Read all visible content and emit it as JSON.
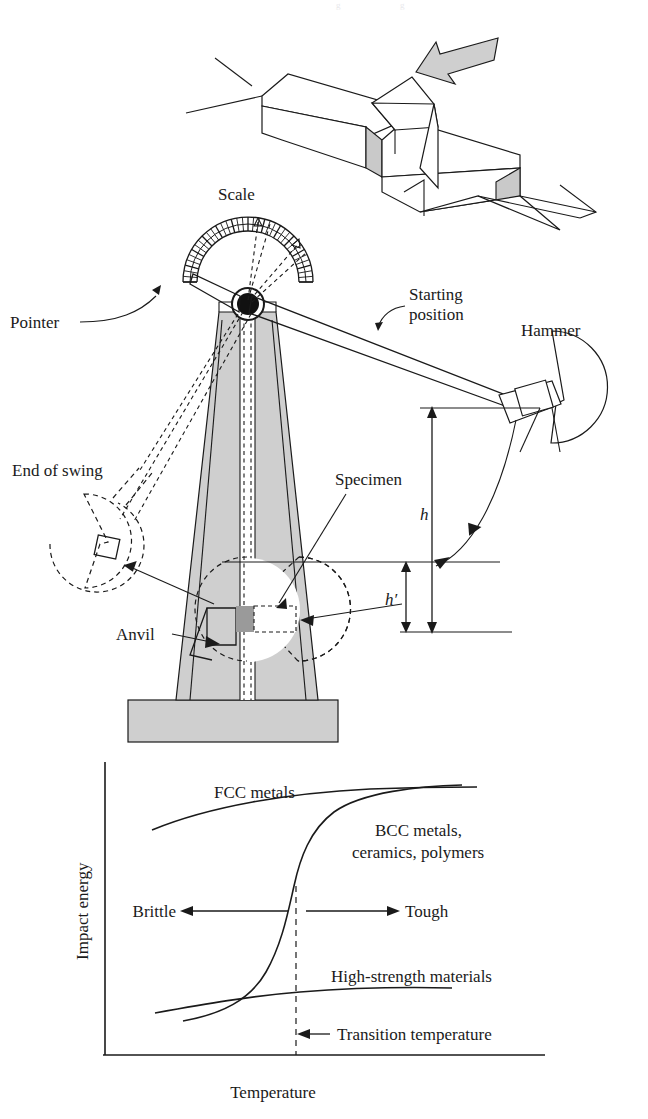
{
  "figure": {
    "colors": {
      "ink": "#1a1a1a",
      "machine_gray": "#cfcfcf",
      "specimen_gray": "#9a9a9a",
      "background": "#ffffff"
    }
  },
  "specimen_detail": {
    "name": "charpy-v-notch-specimen",
    "impact_arrow": "impact-load-arrow",
    "description": "Notched bar specimen struck by hammer"
  },
  "apparatus": {
    "labels": {
      "scale": "Scale",
      "pointer": "Pointer",
      "starting_position": "Starting\nposition",
      "starting_position_line1": "Starting",
      "starting_position_line2": "position",
      "hammer": "Hammer",
      "end_of_swing": "End of swing",
      "specimen": "Specimen",
      "anvil": "Anvil",
      "height_start": "h",
      "height_end": "h′"
    }
  },
  "chart_data": {
    "type": "line",
    "title": "",
    "xlabel": "Temperature",
    "ylabel": "Impact energy",
    "xlim": [
      0,
      100
    ],
    "ylim": [
      0,
      100
    ],
    "grid": false,
    "legend": "inline-annotations",
    "x_tick_labels": [],
    "y_tick_labels": [],
    "series": [
      {
        "name": "FCC metals",
        "label": "FCC metals",
        "label_lines": [
          "FCC metals"
        ],
        "x": [
          12,
          25,
          40,
          55,
          70,
          85,
          96
        ],
        "y": [
          73,
          78,
          82,
          85,
          87,
          89,
          90
        ]
      },
      {
        "name": "BCC metals, ceramics, polymers",
        "label": "BCC metals,\nceramics, polymers",
        "label_lines": [
          "BCC metals,",
          "ceramics, polymers"
        ],
        "x": [
          14,
          25,
          34,
          40,
          44,
          47,
          50,
          53,
          58,
          66,
          78,
          92
        ],
        "y": [
          5,
          8,
          13,
          19,
          27,
          38,
          50,
          62,
          74,
          82,
          87,
          89
        ]
      },
      {
        "name": "High-strength materials",
        "label": "High-strength materials",
        "label_lines": [
          "High-strength materials"
        ],
        "x": [
          12,
          25,
          38,
          50,
          62,
          75,
          88,
          95
        ],
        "y": [
          9,
          13,
          17,
          20,
          22,
          23,
          23.5,
          23
        ]
      }
    ],
    "annotations": [
      {
        "name": "brittle-arrow-label",
        "text": "Brittle",
        "direction": "left",
        "x": 48,
        "y": 50
      },
      {
        "name": "tough-arrow-label",
        "text": "Tough",
        "direction": "right",
        "x": 52,
        "y": 50
      },
      {
        "name": "transition-temperature-label",
        "text": "Transition temperature",
        "direction": "left",
        "x": 52,
        "y": 7
      }
    ],
    "markers": [
      {
        "name": "transition-temperature-line",
        "type": "vline",
        "x": 50,
        "style": "dashed"
      }
    ]
  }
}
